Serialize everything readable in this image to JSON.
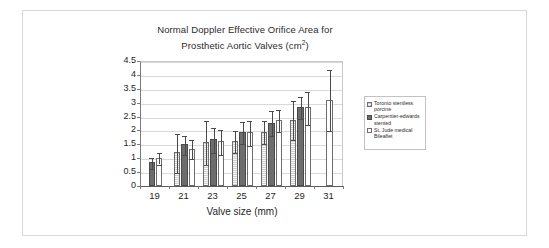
{
  "chart_data": {
    "type": "bar",
    "title": "Normal Doppler Effective Orifice Area for Prosthetic Aortic Valves (cm2)",
    "title_line1": "Normal Doppler Effective Orifice Area for",
    "title_line2_pre": "Prosthetic Aortic Valves (cm",
    "title_line2_sup": "2",
    "title_line2_post": ")",
    "xlabel": "Valve size (mm)",
    "ylabel": "",
    "categories": [
      "19",
      "21",
      "23",
      "25",
      "27",
      "29",
      "31"
    ],
    "ylim": [
      0,
      4.5
    ],
    "yticks": [
      "0",
      "0.5",
      "1",
      "1.5",
      "2",
      "2.5",
      "3",
      "3.5",
      "4",
      "4.5"
    ],
    "grid": true,
    "legend_position": "right",
    "series": [
      {
        "name": "Toronto stentless porcine",
        "legend_line1": "Toronto stentless",
        "legend_line2": "porcine",
        "color": "#cfcfcf",
        "values": [
          null,
          1.21,
          1.58,
          1.62,
          1.96,
          2.39,
          null
        ],
        "err_low": [
          null,
          0.7,
          0.8,
          0.4,
          0.4,
          0.7,
          null
        ],
        "err_high": [
          null,
          0.7,
          0.8,
          0.4,
          0.4,
          0.7,
          null
        ]
      },
      {
        "name": "Carpentier-edwards stented",
        "legend_line1": "Carpentier-edwards",
        "legend_line2": "stented",
        "color": "#6d6d6d",
        "values": [
          0.85,
          1.5,
          1.69,
          1.94,
          2.27,
          2.84,
          null
        ],
        "err_low": [
          0.2,
          0.35,
          0.45,
          0.4,
          0.45,
          0.4,
          null
        ],
        "err_high": [
          0.2,
          0.35,
          0.45,
          0.4,
          0.45,
          0.4,
          null
        ]
      },
      {
        "name": "St. Jude medical Bileaflet",
        "legend_line1": "St. Jude medical",
        "legend_line2": "Bileaflet",
        "color": "#ffffff",
        "values": [
          1.01,
          1.35,
          1.62,
          1.93,
          2.38,
          2.83,
          3.11
        ],
        "err_low": [
          0.2,
          0.35,
          0.45,
          0.45,
          0.4,
          0.6,
          1.1
        ],
        "err_high": [
          0.2,
          0.35,
          0.45,
          0.45,
          0.4,
          0.6,
          1.1
        ]
      }
    ]
  }
}
